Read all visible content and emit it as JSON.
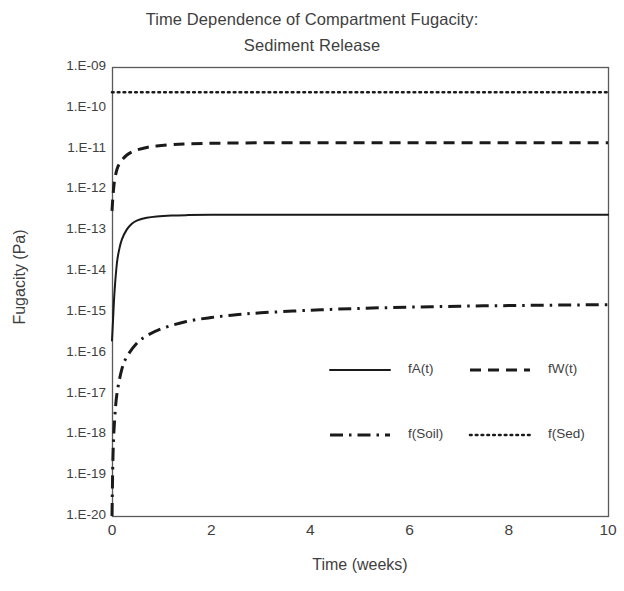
{
  "chart_data": {
    "type": "line",
    "title": "Time Dependence of Compartment Fugacity: Sediment Release",
    "title_line1": "Time Dependence of Compartment Fugacity:",
    "title_line2": "Sediment Release",
    "xlabel": "Time (weeks)",
    "ylabel": "Fugacity (Pa)",
    "yscale": "log",
    "ylim": [
      1e-20,
      1e-09
    ],
    "xlim": [
      0,
      10
    ],
    "grid": false,
    "legend_position": "inside-lower-right",
    "xticks": [
      0,
      2,
      4,
      6,
      8,
      10
    ],
    "xtick_labels": [
      "0",
      "2",
      "4",
      "6",
      "8",
      "10"
    ],
    "ytick_labels": [
      "1.E-09",
      "1.E-10",
      "1.E-11",
      "1.E-12",
      "1.E-13",
      "1.E-14",
      "1.E-15",
      "1.E-16",
      "1.E-17",
      "1.E-18",
      "1.E-19",
      "1.E-20"
    ],
    "ytick_values": [
      1e-09,
      1e-10,
      1e-11,
      1e-12,
      1e-13,
      1e-14,
      1e-15,
      1e-16,
      1e-17,
      1e-18,
      1e-19,
      1e-20
    ],
    "series": [
      {
        "name": "fA(t)",
        "style": "solid",
        "color": "#1a1a1a",
        "x": [
          0,
          0.02,
          0.05,
          0.1,
          0.15,
          0.2,
          0.3,
          0.4,
          0.5,
          0.7,
          0.9,
          1.2,
          1.5,
          2,
          3,
          4,
          5,
          6,
          7,
          8,
          9,
          10
        ],
        "y": [
          2e-16,
          6e-16,
          3e-15,
          1.6e-14,
          3.6e-14,
          6e-14,
          1.05e-13,
          1.45e-13,
          1.72e-13,
          2.02e-13,
          2.18e-13,
          2.3e-13,
          2.35e-13,
          2.39e-13,
          2.4e-13,
          2.4e-13,
          2.4e-13,
          2.4e-13,
          2.4e-13,
          2.4e-13,
          2.4e-13,
          2.4e-13
        ]
      },
      {
        "name": "fW(t)",
        "style": "dashed",
        "color": "#1a1a1a",
        "x": [
          0,
          0.02,
          0.05,
          0.1,
          0.15,
          0.2,
          0.3,
          0.4,
          0.5,
          0.7,
          0.9,
          1.2,
          1.5,
          2,
          3,
          4,
          5,
          6,
          7,
          8,
          9,
          10
        ],
        "y": [
          3e-13,
          7e-13,
          1.6e-12,
          3.1e-12,
          4.3e-12,
          5.3e-12,
          7e-12,
          8.3e-12,
          9.3e-12,
          1.07e-11,
          1.16e-11,
          1.25e-11,
          1.3e-11,
          1.35e-11,
          1.39e-11,
          1.4e-11,
          1.4e-11,
          1.4e-11,
          1.4e-11,
          1.4e-11,
          1.4e-11,
          1.4e-11
        ]
      },
      {
        "name": "f(Soil)",
        "style": "dashdot",
        "color": "#1a1a1a",
        "x": [
          0,
          0.02,
          0.05,
          0.1,
          0.2,
          0.3,
          0.5,
          0.7,
          1.0,
          1.5,
          2,
          2.5,
          3,
          4,
          5,
          6,
          7,
          8,
          9,
          10
        ],
        "y": [
          1e-20,
          3e-19,
          2e-18,
          1e-17,
          4e-17,
          8e-17,
          1.7e-16,
          2.6e-16,
          3.9e-16,
          5.8e-16,
          7.3e-16,
          8.5e-16,
          9.5e-16,
          1.1e-15,
          1.22e-15,
          1.31e-15,
          1.38e-15,
          1.43e-15,
          1.47e-15,
          1.5e-15
        ]
      },
      {
        "name": "f(Sed)",
        "style": "dotted",
        "color": "#1a1a1a",
        "x": [
          0,
          10
        ],
        "y": [
          2.4e-10,
          2.4e-10
        ]
      }
    ]
  },
  "legend": {
    "entries": [
      {
        "label": "fA(t)",
        "style": "solid"
      },
      {
        "label": "fW(t)",
        "style": "dashed"
      },
      {
        "label": "f(Soil)",
        "style": "dashdot"
      },
      {
        "label": "f(Sed)",
        "style": "dotted"
      }
    ]
  },
  "axes": {
    "frame_color": "#595959",
    "text_color": "#3f3f3f"
  }
}
